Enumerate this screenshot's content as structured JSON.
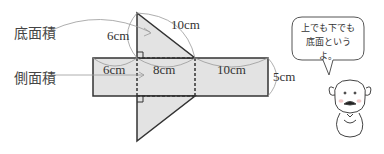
{
  "labels": {
    "base_area": "底面積",
    "lateral_area": "側面積"
  },
  "dimensions": {
    "triangle_height": "6cm",
    "triangle_hypotenuse": "10cm",
    "rect_left_width": "6cm",
    "rect_mid_width": "8cm",
    "rect_right_width": "10cm",
    "rect_height": "5cm"
  },
  "speech_bubble": {
    "line1": "上でも下でも",
    "line2": "底面というよ。"
  },
  "colors": {
    "fill": "#e3e3e3",
    "stroke": "#333333",
    "leader": "#999999"
  }
}
